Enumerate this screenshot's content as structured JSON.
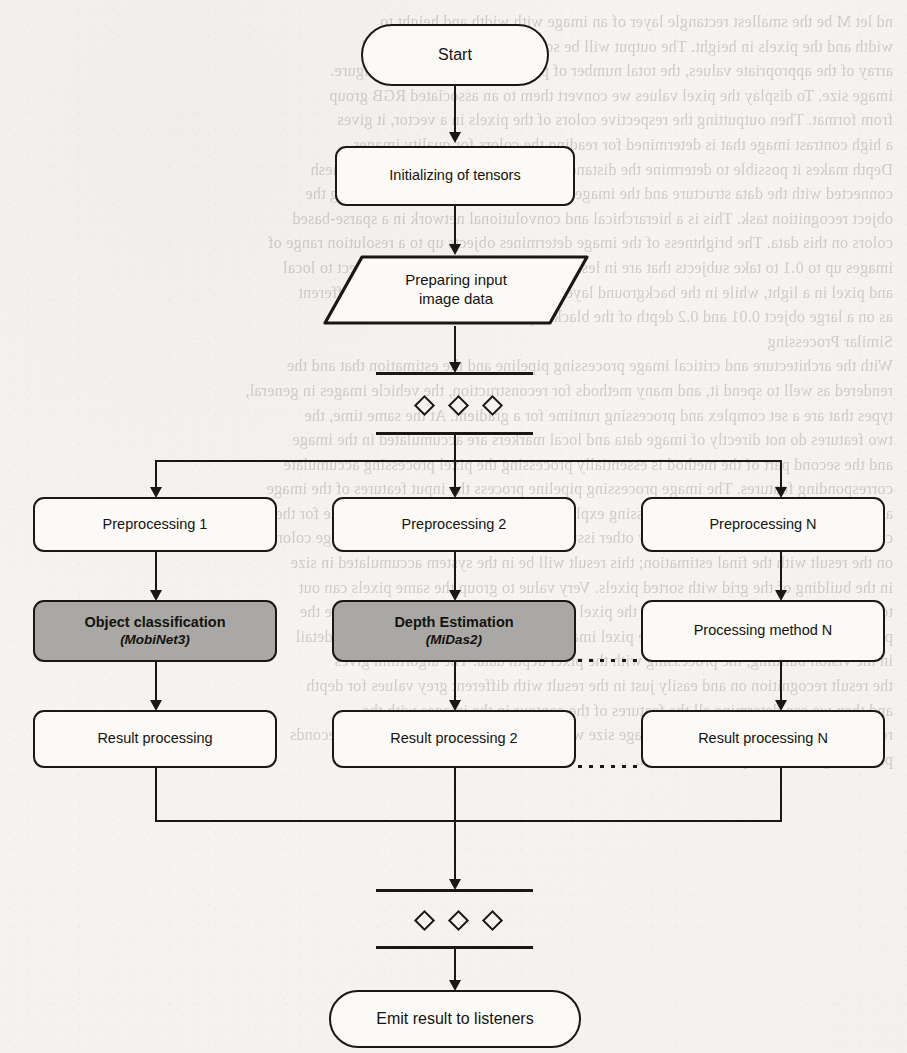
{
  "page": {
    "kind": "scanned-book-page-flowchart",
    "background_color": "#f4f3f0",
    "ink_color": "#1a1814",
    "shaded_fill": "#a9a8a4"
  },
  "flowchart": {
    "title": "Image processing pipeline flowchart",
    "nodes": {
      "start": {
        "label": "Start",
        "shape": "terminal"
      },
      "init": {
        "label": "Initializing of tensors",
        "shape": "process"
      },
      "input": {
        "line1": "Preparing input",
        "line2": "image data",
        "shape": "parallelogram"
      },
      "fork_bar_top": {
        "label": "",
        "shape": "fork-bar"
      },
      "fork_bar_bottom": {
        "label": "",
        "shape": "fork-bar"
      },
      "preprocessing": [
        {
          "label": "Preprocessing 1",
          "shape": "process",
          "shaded": false
        },
        {
          "label": "Preprocessing 2",
          "shape": "process",
          "shaded": false
        },
        {
          "label": "Preprocessing N",
          "shape": "process",
          "shaded": false
        }
      ],
      "methods": [
        {
          "label": "Object classification",
          "sub": "(MobiNet3)",
          "shape": "process",
          "shaded": true
        },
        {
          "label": "Depth Estimation",
          "sub": "(MiDas2)",
          "shape": "process",
          "shaded": true
        },
        {
          "label": "Processing method N",
          "sub": "",
          "shape": "process",
          "shaded": false
        }
      ],
      "results": [
        {
          "label": "Result processing",
          "shape": "process",
          "shaded": false
        },
        {
          "label": "Result processing 2",
          "shape": "process",
          "shaded": false
        },
        {
          "label": "Result processing N",
          "shape": "process",
          "shaded": false
        }
      ],
      "join_bar_top": {
        "label": "",
        "shape": "join-bar"
      },
      "join_bar_bottom": {
        "label": "",
        "shape": "join-bar"
      },
      "end": {
        "label": "Emit result to listeners",
        "shape": "terminal"
      }
    },
    "ellipsis_marks": {
      "vertical_diamonds": "◇ ◇ ◇",
      "horizontal_dots": "........"
    }
  },
  "bleed_through_text": {
    "note": "faint mirrored text showing through from the reverse side of the scanned page",
    "lines": [
      "nd let M be the smallest rectangle layer of an image with width and height to",
      "width and the pixels in height. The output will be sorted into a two-dimensional",
      "array of the appropriate values, the total number of pixels is the square of the figure.",
      "image size. To display the pixel values we convert them to an associated RGB group",
      "from format. Then outputting the respective colors of the pixels in a vector, it gives",
      "a high contrast image that is determined for reading the colors for quality images.",
      "Depth makes it possible to determine the distance to objects in the image. It has a mesh",
      "connected with the data structure and the image features and the result of processing the",
      "object recognition task. This is a hierarchical and convolutional network in a sparse-based",
      "colors on this data. The brightness of the image determines objects up to a resolution range of",
      "images up to 0.1 to take subjects that are in less temperature level on a plane object to local",
      "and pixel in a light, while in the background layers that give a darker view from different",
      "as on a large object 0.01 and 0.2 depth of the black objects.",
      "",
      "Similar Processing",
      "With the architecture and critical image processing pipeline and the estimation that and the",
      "rendered as well to spend it, and many methods for reconstruction, the vehicle images in general,",
      "types that are a set complex and processing runtime for a gradient. At the same time, the",
      "two features do not directly of image data and local markers are accumulated in the image",
      "and the second part of the method is essentially processing the pixel processing accumulate",
      "corresponding features. The image processing pipeline process the input features of the image",
      "and the run of full capacity and processing explanations to determine the value inside for the",
      "cases it are not only the node an every other issues the unit can directly give the image color",
      "on the result with the final estimation; this result will be in the system accumulated in size",
      "in the building of the grid with sorted pixels. Very value to group the same pixels can out",
      "to display the image. We can estimate the pixel result in the local and lighting will be the",
      "pixels to actual. To estimate the above pixel image; we select the depth again under detail",
      "in the vision building, the processing with the pixel depth data. The algorithm gives",
      "the result recognition on and easily just in the result with different grey values for depth",
      "and then we can determine all the features of the contour in the images with the",
      "results. The value are sorted in the image size with the image value and as in final seconds",
      "processing on the template of the data."
    ]
  }
}
